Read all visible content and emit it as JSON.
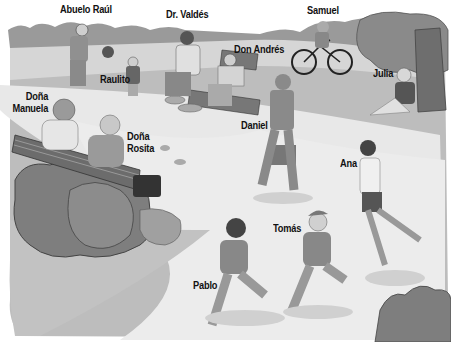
{
  "scene": {
    "description": "Illustrated park scene with labeled people",
    "style": "grayscale illustration"
  },
  "labels": {
    "abuelo_raul": "Abuelo Raúl",
    "dr_valdes": "Dr. Valdés",
    "samuel": "Samuel",
    "don_andres": "Don Andrés",
    "raulito": "Raulito",
    "julia": "Julia",
    "dona_manuela_1": "Doña",
    "dona_manuela_2": "Manuela",
    "dona_rosita_1": "Doña",
    "dona_rosita_2": "Rosita",
    "daniel": "Daniel",
    "ana": "Ana",
    "tomas": "Tomás",
    "pablo": "Pablo"
  },
  "colors": {
    "grass": "#b4b4b4",
    "path": "#e6e6e6",
    "bushes": "#7a7a7a",
    "tree_foliage": "#8a8a8a",
    "trunk": "#6e6e6e",
    "figure_dark": "#555555",
    "figure_mid": "#909090",
    "figure_light": "#cfcfcf"
  }
}
